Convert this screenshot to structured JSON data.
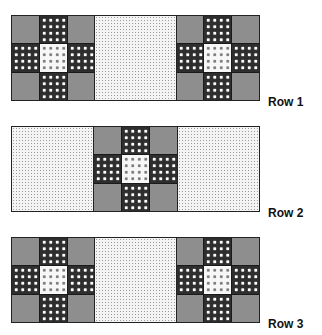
{
  "diagram": {
    "rows": [
      {
        "label": "Row 1",
        "layout": [
          "nine-patch",
          "plain",
          "nine-patch"
        ]
      },
      {
        "label": "Row 2",
        "layout": [
          "plain",
          "nine-patch",
          "plain"
        ]
      },
      {
        "label": "Row 3",
        "layout": [
          "nine-patch",
          "plain",
          "nine-patch"
        ]
      }
    ],
    "nine_patch": {
      "corners": "gray solid",
      "edges": "dark with white stars",
      "center": "light with gray stars"
    },
    "plain_block": "light dotted",
    "colors": {
      "corner": "#8e8e8e",
      "edge": "#2e2e2e",
      "center": "#f7f7f7",
      "plain": "#f4f4f4",
      "outline": "#222222"
    }
  }
}
